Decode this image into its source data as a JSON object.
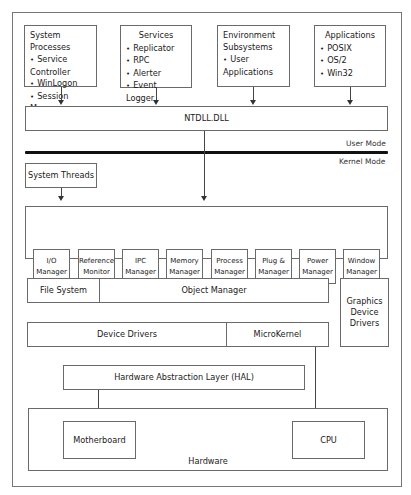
{
  "diagram": {
    "user_space": {
      "system_processes": {
        "title": "System Processes",
        "items": [
          "Service Controller",
          "WinLogon",
          "Session Manager"
        ]
      },
      "services": {
        "title": "Services",
        "items": [
          "Replicator",
          "RPC",
          "Alerter",
          "Event Logger"
        ]
      },
      "environment_subsystems": {
        "title_line1": "Environment",
        "title_line2": "Subsystems",
        "items": [
          "User Applications"
        ]
      },
      "applications": {
        "title": "Applications",
        "items": [
          "POSIX",
          "OS/2",
          "Win32"
        ]
      },
      "ntdll": "NTDLL.DLL"
    },
    "mode_boundary": {
      "user_mode": "User Mode",
      "kernel_mode": "Kernel Mode"
    },
    "kernel_space": {
      "system_threads": "System Threads",
      "executive_managers": [
        {
          "line1": "I/O",
          "line2": "Manager"
        },
        {
          "line1": "Reference",
          "line2": "Monitor"
        },
        {
          "line1": "IPC",
          "line2": "Manager"
        },
        {
          "line1": "Memory",
          "line2": "Manager"
        },
        {
          "line1": "Process",
          "line2": "Manager"
        },
        {
          "line1": "Plug &",
          "line2": "Manager"
        },
        {
          "line1": "Power",
          "line2": "Manager"
        },
        {
          "line1": "Window",
          "line2": "Manager"
        }
      ],
      "file_system": "File System",
      "object_manager": "Object Manager",
      "graphics_device_drivers": {
        "line1": "Graphics",
        "line2": "Device",
        "line3": "Drivers"
      },
      "device_drivers": "Device Drivers",
      "microkernel": "MicroKernel",
      "hal": "Hardware Abstraction Layer (HAL)"
    },
    "hardware": {
      "label": "Hardware",
      "motherboard": "Motherboard",
      "cpu": "CPU"
    }
  }
}
